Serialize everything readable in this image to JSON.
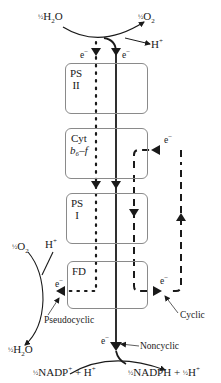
{
  "diagram": {
    "reactants_top": {
      "water": {
        "coef": "½",
        "formula": "H",
        "sub": "2",
        "tail": "O"
      },
      "oxygen": {
        "coef": "½",
        "formula": "O",
        "sub": "2"
      },
      "proton": {
        "formula": "H",
        "sup": "+"
      }
    },
    "complexes": [
      {
        "id": "ps2",
        "line1": "PS",
        "line2": "II"
      },
      {
        "id": "cyt",
        "line1": "Cyt",
        "line2": "b₆–f"
      },
      {
        "id": "ps1",
        "line1": "PS",
        "line2": "I"
      },
      {
        "id": "fd",
        "line1": "FD",
        "line2": ""
      }
    ],
    "electron_label": "e",
    "electron_sup": "−",
    "pseudocyclic_side": {
      "oxygen": {
        "coef": "½",
        "formula": "O",
        "sub": "2"
      },
      "proton": {
        "formula": "H",
        "sup": "+"
      },
      "water": {
        "coef": "½",
        "formula": "H",
        "sub": "2",
        "tail": "O"
      }
    },
    "pathway_labels": {
      "pseudocyclic": "Pseudocyclic",
      "cyclic": "Cyclic",
      "noncyclic": "Noncyclic"
    },
    "products_bottom": {
      "left": {
        "coef": "½",
        "text": "NADP",
        "sup": "+",
        "rest": " + H",
        "rest_sup": "+"
      },
      "right": {
        "coef": "½",
        "text": "NADPH + ",
        "coef2": "½",
        "rest": "H",
        "rest_sup": "+"
      }
    },
    "colors": {
      "line": "#1a1a1a",
      "box_border": "#8a8a8a",
      "background": "#ffffff"
    }
  }
}
